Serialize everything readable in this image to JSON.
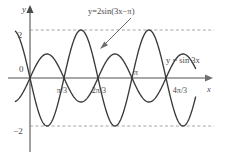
{
  "figure": {
    "title": "",
    "background_color": "#ffffff",
    "curve_color": "#3a3a3a",
    "axis_color": "#8a8a8a",
    "dash_color": "#9a9a9a",
    "text_color": "#4a4a4a"
  },
  "axes": {
    "x_axis_label": "x",
    "y_axis_label": "y",
    "origin_label": "0",
    "x_ticks": [
      {
        "label": "π/3",
        "value": 1.0472
      },
      {
        "label": "2π/3",
        "value": 2.0944
      },
      {
        "label": "π",
        "value": 3.1416
      },
      {
        "label": "4π/3",
        "value": 4.1888
      }
    ],
    "y_ticks": [
      {
        "label": "2",
        "value": 2
      },
      {
        "label": "−2",
        "value": -2
      }
    ]
  },
  "annotations": {
    "callout_label": "y=2sin(3x−π)",
    "inline_label": "y = sin 3x"
  },
  "chart_data": {
    "type": "line",
    "title": "",
    "xlabel": "x",
    "ylabel": "y",
    "xlim": [
      -0.45,
      5.1
    ],
    "ylim": [
      -2.6,
      2.6
    ],
    "grid": false,
    "legend": "inline-annotations",
    "x_tick_labels": [
      "π/3",
      "2π/3",
      "π",
      "4π/3"
    ],
    "x_tick_values": [
      1.0472,
      2.0944,
      3.1416,
      4.1888
    ],
    "y_tick_labels": [
      "2",
      "−2"
    ],
    "y_tick_values": [
      2,
      -2
    ],
    "reference_lines": [
      {
        "axis": "y",
        "value": 2,
        "style": "dashed"
      },
      {
        "axis": "y",
        "value": -2,
        "style": "dashed"
      }
    ],
    "series": [
      {
        "name": "y = sin 3x",
        "expression": "sin(3x)",
        "amplitude": 1,
        "period": 2.0944,
        "phase_shift": 0,
        "style": "solid",
        "color": "#3a3a3a"
      },
      {
        "name": "y=2sin(3x−π)",
        "expression": "2*sin(3x - pi)",
        "amplitude": 2,
        "period": 2.0944,
        "phase_shift": 1.0472,
        "style": "solid",
        "color": "#3a3a3a"
      }
    ]
  }
}
